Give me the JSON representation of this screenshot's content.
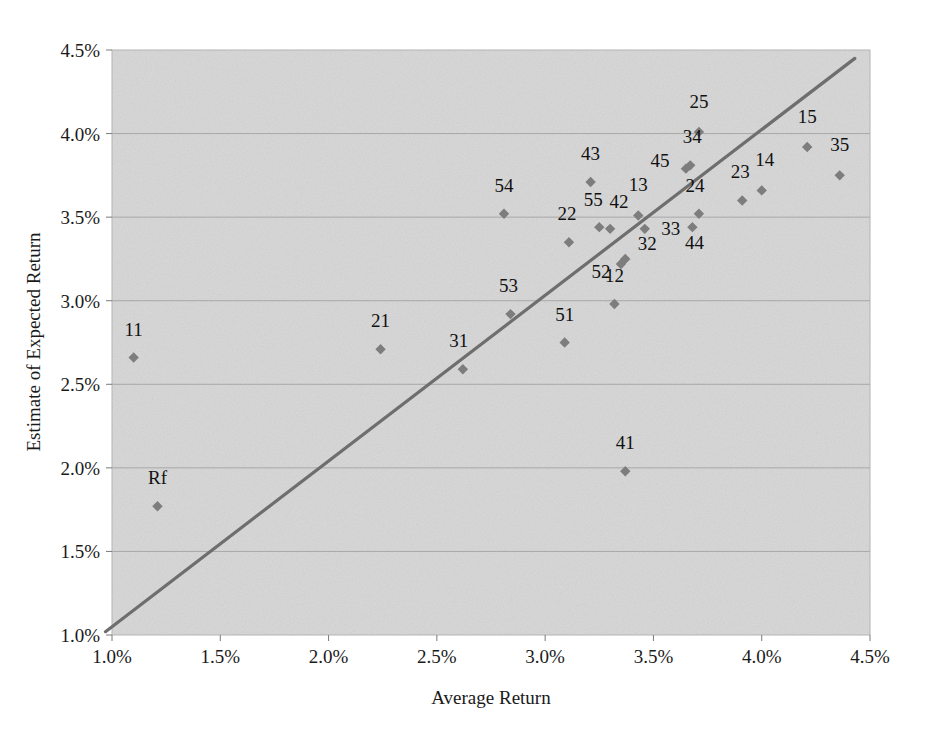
{
  "chart_data": {
    "type": "scatter",
    "title": "",
    "xlabel": "Average Return",
    "ylabel": "Estimate of Expected Return",
    "xlim": [
      1.0,
      4.5
    ],
    "ylim": [
      1.0,
      4.5
    ],
    "xticks": [
      "1.0%",
      "1.5%",
      "2.0%",
      "2.5%",
      "3.0%",
      "3.5%",
      "4.0%",
      "4.5%"
    ],
    "xtick_values": [
      1.0,
      1.5,
      2.0,
      2.5,
      3.0,
      3.5,
      4.0,
      4.5
    ],
    "yticks": [
      "1.0%",
      "1.5%",
      "2.0%",
      "2.5%",
      "3.0%",
      "3.5%",
      "4.0%",
      "4.5%"
    ],
    "ytick_values": [
      1.0,
      1.5,
      2.0,
      2.5,
      3.0,
      3.5,
      4.0,
      4.5
    ],
    "grid": "horizontal",
    "legend": "none",
    "plot_background": "#d9d9d9",
    "marker_color": "#7d7d7d",
    "line_color": "#6e6e6e",
    "reference_line": {
      "label": "45-degree line",
      "x": [
        0.97,
        4.43
      ],
      "y": [
        1.02,
        4.45
      ]
    },
    "points": [
      {
        "label": "11",
        "x": 1.1,
        "y": 2.66,
        "label_dx": 0,
        "label_dy": -22
      },
      {
        "label": "Rf",
        "x": 1.21,
        "y": 1.77,
        "label_dx": 0,
        "label_dy": -22
      },
      {
        "label": "21",
        "x": 2.24,
        "y": 2.71,
        "label_dx": 0,
        "label_dy": -22
      },
      {
        "label": "31",
        "x": 2.62,
        "y": 2.59,
        "label_dx": -4,
        "label_dy": -22
      },
      {
        "label": "54",
        "x": 2.81,
        "y": 3.52,
        "label_dx": 0,
        "label_dy": -22
      },
      {
        "label": "53",
        "x": 2.84,
        "y": 2.92,
        "label_dx": -2,
        "label_dy": -22
      },
      {
        "label": "51",
        "x": 3.09,
        "y": 2.75,
        "label_dx": 0,
        "label_dy": -22
      },
      {
        "label": "22",
        "x": 3.11,
        "y": 3.35,
        "label_dx": -2,
        "label_dy": -22
      },
      {
        "label": "43",
        "x": 3.21,
        "y": 3.71,
        "label_dx": 0,
        "label_dy": -22
      },
      {
        "label": "55",
        "x": 3.25,
        "y": 3.44,
        "label_dx": -6,
        "label_dy": -21
      },
      {
        "label": "42",
        "x": 3.3,
        "y": 3.43,
        "label_dx": 9,
        "label_dy": -21
      },
      {
        "label": "52",
        "x": 3.35,
        "y": 3.22,
        "label_dx": -20,
        "label_dy": 14
      },
      {
        "label": "32",
        "x": 3.37,
        "y": 3.25,
        "label_dx": 22,
        "label_dy": -9
      },
      {
        "label": "12",
        "x": 3.32,
        "y": 2.98,
        "label_dx": 0,
        "label_dy": -22
      },
      {
        "label": "41",
        "x": 3.37,
        "y": 1.98,
        "label_dx": 0,
        "label_dy": -22
      },
      {
        "label": "13",
        "x": 3.43,
        "y": 3.51,
        "label_dx": 0,
        "label_dy": -24
      },
      {
        "label": "33",
        "x": 3.46,
        "y": 3.43,
        "label_dx": 26,
        "label_dy": 6
      },
      {
        "label": "25",
        "x": 3.71,
        "y": 4.01,
        "label_dx": 0,
        "label_dy": -24
      },
      {
        "label": "45",
        "x": 3.65,
        "y": 3.79,
        "label_dx": -26,
        "label_dy": -2
      },
      {
        "label": "34",
        "x": 3.67,
        "y": 3.81,
        "label_dx": 2,
        "label_dy": -22
      },
      {
        "label": "44",
        "x": 3.68,
        "y": 3.44,
        "label_dx": 2,
        "label_dy": 22
      },
      {
        "label": "24",
        "x": 3.71,
        "y": 3.52,
        "label_dx": -4,
        "label_dy": -22
      },
      {
        "label": "23",
        "x": 3.91,
        "y": 3.6,
        "label_dx": -2,
        "label_dy": -22
      },
      {
        "label": "14",
        "x": 4.0,
        "y": 3.66,
        "label_dx": 3,
        "label_dy": -24
      },
      {
        "label": "15",
        "x": 4.21,
        "y": 3.92,
        "label_dx": 0,
        "label_dy": -24
      },
      {
        "label": "35",
        "x": 4.36,
        "y": 3.75,
        "label_dx": 0,
        "label_dy": -24
      }
    ]
  }
}
